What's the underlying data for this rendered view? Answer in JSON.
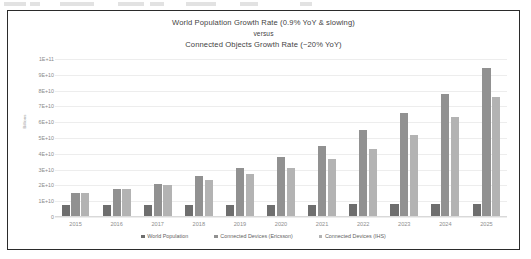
{
  "chart_data": {
    "type": "bar",
    "title": "World Population Growth Rate (0.9% YoY & slowing) versus Connected Objects Growth Rate (~20% YoY)",
    "title_lines": [
      "World Population Growth Rate (0.9% YoY & slowing)",
      "versus",
      "Connected Objects Growth Rate (~20% YoY)"
    ],
    "xlabel": "",
    "ylabel": "Billions",
    "ylim": [
      0,
      100000000000
    ],
    "grid": true,
    "legend_position": "bottom",
    "categories": [
      "2015",
      "2016",
      "2017",
      "2018",
      "2019",
      "2020",
      "2021",
      "2022",
      "2023",
      "2024",
      "2025"
    ],
    "ytick_labels": [
      "1E+11",
      "9E+10",
      "8E+10",
      "7E+10",
      "6E+10",
      "5E+10",
      "4E+10",
      "3E+10",
      "2E+10",
      "1E+10",
      "0"
    ],
    "ytick_values": [
      100000000000,
      90000000000,
      80000000000,
      70000000000,
      60000000000,
      50000000000,
      40000000000,
      30000000000,
      20000000000,
      10000000000,
      0
    ],
    "series": [
      {
        "name": "World Population",
        "color": "#6e6e6e",
        "values": [
          7300000000,
          7400000000,
          7500000000,
          7600000000,
          7700000000,
          7800000000,
          7900000000,
          8000000000,
          8100000000,
          8200000000,
          8300000000
        ]
      },
      {
        "name": "Connected Devices (Ericsson)",
        "color": "#919191",
        "values": [
          15000000000,
          18000000000,
          21000000000,
          26000000000,
          31000000000,
          38000000000,
          45000000000,
          55000000000,
          66000000000,
          78000000000,
          94000000000
        ]
      },
      {
        "name": "Connected Devices (IHS)",
        "color": "#b3b3b3",
        "values": [
          15500000000,
          18000000000,
          20500000000,
          23500000000,
          27000000000,
          31000000000,
          36500000000,
          43000000000,
          52000000000,
          63000000000,
          76000000000
        ]
      }
    ]
  },
  "legend": {
    "items": [
      {
        "label": "World Population"
      },
      {
        "label": "Connected Devices (Ericsson)"
      },
      {
        "label": "Connected Devices (IHS)"
      }
    ]
  }
}
